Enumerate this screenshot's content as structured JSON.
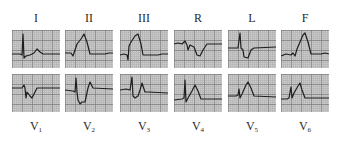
{
  "figure": {
    "rows": [
      {
        "leads": [
          {
            "label": "I",
            "sub": "",
            "x": 12,
            "trace": "0,24 8,24 10,25 11,4 12,28 14,26 18,25 22,23 25,19 28,22 31,24 48,24"
          },
          {
            "label": "II",
            "sub": "",
            "x": 65,
            "trace": "0,23 6,23 8,26 10,20 12,14 16,9 19,4 22,12 25,24 40,24 44,23 48,23"
          },
          {
            "label": "III",
            "sub": "",
            "x": 120,
            "trace": "0,25 4,24 7,25 8,30 9,16 11,12 15,6 18,4 21,14 23,25 38,25 42,24 48,24"
          },
          {
            "label": "R",
            "sub": "",
            "x": 174,
            "trace": "0,14 4,13 8,14 11,11 13,15 14,20 16,15 20,17 23,25 26,26 29,20 33,14 48,14"
          },
          {
            "label": "L",
            "sub": "",
            "x": 228,
            "trace": "0,18 10,18 12,3 13,18 15,20 16,27 20,28 23,20 26,18 48,17"
          },
          {
            "label": "F",
            "sub": "",
            "x": 281,
            "trace": "0,26 5,24 10,25 12,23 14,26 16,19 19,12 22,5 24,3 27,12 30,24 40,24 44,23 48,24"
          }
        ],
        "label_y": 12,
        "panel_y": 30
      },
      {
        "leads": [
          {
            "label": "V",
            "sub": "1",
            "x": 12,
            "trace": "0,14 10,14 12,11 13,14 14,24 15,18 18,22 20,24 23,18 25,14 48,14"
          },
          {
            "label": "V",
            "sub": "2",
            "x": 65,
            "trace": "0,16 8,17 10,18 11,4 12,18 13,26 15,30 17,28 20,28 23,14 25,8 28,14 48,15"
          },
          {
            "label": "V",
            "sub": "3",
            "x": 120,
            "trace": "0,16 6,15 10,16 12,3 13,22 15,24 18,22 20,16 22,9 25,18 28,18 48,19"
          },
          {
            "label": "V",
            "sub": "4",
            "x": 174,
            "trace": "0,26 8,25 10,24 11,6 12,28 14,24 18,17 21,11 24,17 27,25 48,25"
          },
          {
            "label": "V",
            "sub": "5",
            "x": 228,
            "trace": "0,22 8,22 10,21 11,15 12,24 14,20 18,11 20,8 23,14 26,22 48,23"
          },
          {
            "label": "V",
            "sub": "6",
            "x": 281,
            "trace": "0,25 6,25 8,24 10,13 11,24 13,19 17,12 19,9 21,16 24,24 48,24"
          }
        ],
        "label_y": 120,
        "panel_y": 74
      }
    ],
    "colors": {
      "paper": "#cbcbcb",
      "grid_minor": "#a9a9a9",
      "grid_major": "#7d7d7d",
      "trace": "#1e1e1e"
    }
  }
}
